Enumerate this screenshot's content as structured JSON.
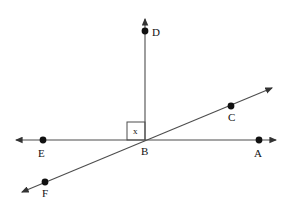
{
  "figure": {
    "watermark_top": "",
    "watermark_bottom": "",
    "stroke_color": "#4d4d4d",
    "point_color": "#111111",
    "label_color": "#111111",
    "background_color": "#ffffff"
  },
  "points": [
    {
      "id": "D",
      "label": "D",
      "x": 145,
      "y": 31,
      "label_x": 152,
      "label_y": 27
    },
    {
      "id": "C",
      "label": "C",
      "x": 231,
      "y": 106,
      "label_x": 228,
      "label_y": 112
    },
    {
      "id": "E",
      "label": "E",
      "x": 43,
      "y": 140,
      "label_x": 38,
      "label_y": 148
    },
    {
      "id": "B",
      "label": "B",
      "x": 145,
      "y": 140,
      "label_x": 141,
      "label_y": 146
    },
    {
      "id": "A",
      "label": "A",
      "x": 259,
      "y": 140,
      "label_x": 254,
      "label_y": 148
    },
    {
      "id": "F",
      "label": "F",
      "x": 45,
      "y": 182,
      "label_x": 42,
      "label_y": 188
    }
  ],
  "lines": [
    {
      "id": "horizontal-EA",
      "name": "line-EA",
      "x1": 16,
      "y1": 140,
      "x2": 276,
      "y2": 140,
      "arrow_start": true,
      "arrow_end": true
    },
    {
      "id": "vertical-BD",
      "name": "ray-BD",
      "x1": 145,
      "y1": 140,
      "x2": 145,
      "y2": 19,
      "arrow_start": false,
      "arrow_end": true
    },
    {
      "id": "diagonal-FC",
      "name": "line-FC",
      "x1": 22,
      "y1": 192,
      "x2": 272,
      "y2": 88,
      "arrow_start": true,
      "arrow_end": true
    }
  ],
  "angle_marker": {
    "name": "right-angle-square",
    "label": "x",
    "x": 127,
    "y": 122,
    "size": 18,
    "label_x": 133,
    "label_y": 127
  }
}
